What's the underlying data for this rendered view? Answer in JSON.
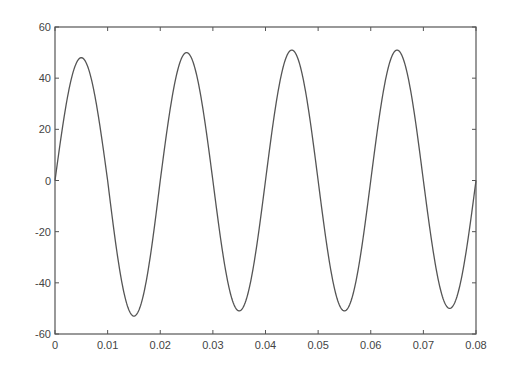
{
  "chart_data": {
    "type": "line",
    "title": "",
    "xlabel": "",
    "ylabel": "",
    "xlim": [
      0,
      0.08
    ],
    "ylim": [
      -60,
      60
    ],
    "grid": false,
    "legend": null,
    "x_ticks": [
      "0",
      "0.01",
      "0.02",
      "0.03",
      "0.04",
      "0.05",
      "0.06",
      "0.07",
      "0.08"
    ],
    "y_ticks": [
      "60",
      "40",
      "20",
      "0",
      "-20",
      "-40",
      "-60"
    ],
    "series": [
      {
        "name": "signal",
        "description": "sinusoid ~50 Hz, amplitude ~50",
        "x": [
          0,
          0.005,
          0.01,
          0.015,
          0.02,
          0.025,
          0.03,
          0.035,
          0.04,
          0.045,
          0.05,
          0.055,
          0.06,
          0.065,
          0.07,
          0.075,
          0.08
        ],
        "values": [
          0,
          48,
          0,
          -53,
          0,
          50,
          0,
          -51,
          0,
          51,
          0,
          -51,
          0,
          51,
          0,
          -50,
          0
        ]
      }
    ],
    "colors": {
      "line": "#555555",
      "axes": "#555555",
      "background": "#ffffff"
    }
  }
}
